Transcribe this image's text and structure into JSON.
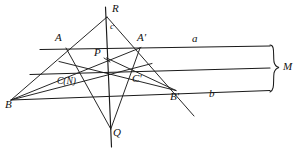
{
  "figure": {
    "stroke_color": "#1a1a1a",
    "background_color": "#ffffff",
    "width": 304,
    "height": 153
  },
  "points": [
    {
      "id": "R",
      "label": "R",
      "x": 107,
      "y": 17,
      "label_x": 112,
      "label_y": 4,
      "size": "normal"
    },
    {
      "id": "A",
      "label": "A",
      "x": 66,
      "y": 48,
      "label_x": 56,
      "label_y": 33,
      "size": "normal"
    },
    {
      "id": "Aq",
      "label": "A'",
      "x": 140,
      "y": 48,
      "label_x": 139,
      "label_y": 33,
      "size": "normal"
    },
    {
      "id": "P",
      "label": "P",
      "x": 107,
      "y": 58,
      "label_x": 95,
      "label_y": 49,
      "size": "normal"
    },
    {
      "id": "C",
      "label": "C(N)",
      "x": 78,
      "y": 72,
      "label_x": 58,
      "label_y": 79,
      "size": "small"
    },
    {
      "id": "Cq",
      "label": "C'",
      "x": 135,
      "y": 71,
      "label_x": 133,
      "label_y": 75,
      "size": "normal"
    },
    {
      "id": "B",
      "label": "B",
      "x": 11,
      "y": 100,
      "label_x": 7,
      "label_y": 101,
      "size": "normal"
    },
    {
      "id": "Bq",
      "label": "B'",
      "x": 175,
      "y": 90,
      "label_x": 172,
      "label_y": 93,
      "size": "normal"
    },
    {
      "id": "Q",
      "label": "Q",
      "x": 110,
      "y": 128,
      "label_x": 113,
      "label_y": 128,
      "size": "normal"
    }
  ],
  "line_labels": [
    {
      "id": "a",
      "label": "a",
      "x": 194,
      "y": 36
    },
    {
      "id": "b",
      "label": "b",
      "x": 211,
      "y": 90
    },
    {
      "id": "c",
      "label": "c",
      "x": 111,
      "y": 24
    },
    {
      "id": "M",
      "label": "M",
      "x": 285,
      "y": 62
    }
  ],
  "lines": [
    {
      "id": "line-a",
      "from": "left-A",
      "x1": 40,
      "y1": 49,
      "x2": 270,
      "y2": 46
    },
    {
      "id": "line-middle",
      "from": "P-right",
      "x1": 30,
      "y1": 74,
      "x2": 270,
      "y2": 68
    },
    {
      "id": "line-b",
      "from": "B-right",
      "x1": 11,
      "y1": 100,
      "x2": 270,
      "y2": 90
    },
    {
      "id": "line-c",
      "from": "R-Q",
      "x1": 106,
      "y1": 7,
      "x2": 111,
      "y2": 146
    },
    {
      "id": "R-B",
      "from": "R",
      "x1": 107,
      "y1": 17,
      "x2": 11,
      "y2": 100
    },
    {
      "id": "R-Bq",
      "from": "R",
      "x1": 107,
      "y1": 17,
      "x2": 193,
      "y2": 115
    },
    {
      "id": "B-Aq",
      "from": "B",
      "x1": 11,
      "y1": 100,
      "x2": 140,
      "y2": 48
    },
    {
      "id": "B-Cq",
      "from": "B",
      "x1": 11,
      "y1": 100,
      "x2": 150,
      "y2": 64
    },
    {
      "id": "A-Q",
      "from": "A",
      "x1": 66,
      "y1": 48,
      "x2": 110,
      "y2": 128
    },
    {
      "id": "Aq-Q",
      "from": "A-prime",
      "x1": 140,
      "y1": 48,
      "x2": 110,
      "y2": 128
    },
    {
      "id": "P-Bq",
      "from": "P",
      "x1": 107,
      "y1": 58,
      "x2": 175,
      "y2": 90
    },
    {
      "id": "C-Aq-ext",
      "from": "C",
      "x1": 60,
      "y1": 62,
      "x2": 175,
      "y2": 90
    }
  ],
  "brace": {
    "id": "brace-M",
    "label": "M",
    "x": 272,
    "top": 45,
    "bottom": 92,
    "mid": 68
  }
}
